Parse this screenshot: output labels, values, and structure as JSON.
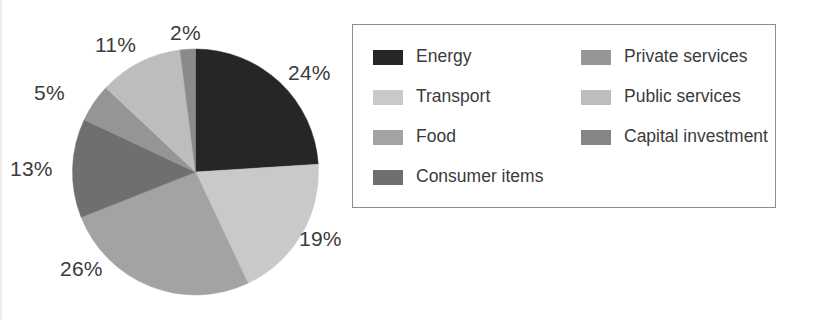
{
  "chart_data": {
    "type": "pie",
    "title": "",
    "subtitle": "",
    "categories": [
      "Energy",
      "Transport",
      "Food",
      "Consumer items",
      "Private services",
      "Public services",
      "Capital investment"
    ],
    "values": [
      24,
      19,
      26,
      13,
      5,
      11,
      2
    ],
    "value_unit": "%",
    "data_labels": [
      "24%",
      "19%",
      "26%",
      "13%",
      "5%",
      "11%",
      "2%"
    ],
    "start_angle_deg": 0,
    "direction": "clockwise",
    "legend_position": "right",
    "grid": false,
    "xlabel": "",
    "ylabel": "",
    "colors": [
      "#262626",
      "#c9c9c9",
      "#a3a3a3",
      "#6f6f6f",
      "#959595",
      "#bdbdbd",
      "#8a8a8a"
    ],
    "slices": [
      {
        "label": "Energy",
        "value": 24,
        "display": "24%",
        "color": "#262626"
      },
      {
        "label": "Transport",
        "value": 19,
        "display": "19%",
        "color": "#c9c9c9"
      },
      {
        "label": "Food",
        "value": 26,
        "display": "26%",
        "color": "#a3a3a3"
      },
      {
        "label": "Consumer items",
        "value": 13,
        "display": "13%",
        "color": "#6f6f6f"
      },
      {
        "label": "Private services",
        "value": 5,
        "display": "5%",
        "color": "#959595"
      },
      {
        "label": "Public services",
        "value": 11,
        "display": "11%",
        "color": "#bdbdbd"
      },
      {
        "label": "Capital investment",
        "value": 2,
        "display": "2%",
        "color": "#8a8a8a"
      }
    ]
  },
  "labels": {
    "pct_energy": "24%",
    "pct_transport": "19%",
    "pct_food": "26%",
    "pct_consumer_items": "13%",
    "pct_private_services": "5%",
    "pct_public_services": "11%",
    "pct_capital_investment": "2%"
  },
  "legend": {
    "left_column": [
      {
        "label": "Energy",
        "color": "#262626"
      },
      {
        "label": "Transport",
        "color": "#c9c9c9"
      },
      {
        "label": "Food",
        "color": "#a3a3a3"
      },
      {
        "label": "Consumer items",
        "color": "#6f6f6f"
      }
    ],
    "right_column": [
      {
        "label": "Private services",
        "color": "#959595"
      },
      {
        "label": "Public services",
        "color": "#bdbdbd"
      },
      {
        "label": "Capital investment",
        "color": "#858585"
      }
    ]
  },
  "style": {
    "label_color": "#3b3b3b",
    "legend_border_color": "#8d8d8d",
    "background": "#ffffff"
  }
}
